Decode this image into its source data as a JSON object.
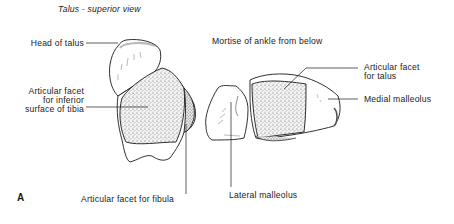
{
  "figure": {
    "title": "Talus - superior view",
    "subtitle": "Mortise of ankle from below",
    "panel_letter": "A"
  },
  "labels": {
    "head_of_talus": "Head of talus",
    "facet_tibia_line1": "Articular facet",
    "facet_tibia_line2": "for inferior",
    "facet_tibia_line3": "surface of tibia",
    "facet_fibula": "Articular facet for fibula",
    "facet_talus_line1": "Articular facet",
    "facet_talus_line2": "for talus",
    "medial_malleolus": "Medial malleolus",
    "lateral_malleolus": "Lateral malleolus"
  },
  "colors": {
    "ink": "#1a1a1a",
    "background": "#ffffff",
    "stipple": "#555555"
  }
}
